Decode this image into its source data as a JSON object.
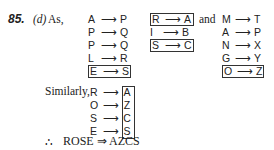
{
  "question": {
    "number": "85.",
    "option": "(d)",
    "intro": "As,"
  },
  "group1": [
    {
      "from": "A",
      "arrow": "⟶",
      "to": "P",
      "boxed": false
    },
    {
      "from": "P",
      "arrow": "⟶",
      "to": "Q",
      "boxed": false
    },
    {
      "from": "P",
      "arrow": "⟶",
      "to": "Q",
      "boxed": false
    },
    {
      "from": "L",
      "arrow": "⟶",
      "to": "R",
      "boxed": false
    },
    {
      "from": "E",
      "arrow": "⟶",
      "to": "S",
      "boxed": true
    }
  ],
  "group2": [
    {
      "from": "R",
      "arrow": "⟶",
      "to": "A",
      "boxed": true
    },
    {
      "from": "I",
      "arrow": "⟶",
      "to": "B",
      "boxed": false
    },
    {
      "from": "S",
      "arrow": "⟶",
      "to": "C",
      "boxed": true
    }
  ],
  "and_label": "and",
  "group3": [
    {
      "from": "M",
      "arrow": "⟶",
      "to": "T",
      "boxed": false
    },
    {
      "from": "A",
      "arrow": "⟶",
      "to": "P",
      "boxed": false
    },
    {
      "from": "N",
      "arrow": "⟶",
      "to": "X",
      "boxed": false
    },
    {
      "from": "G",
      "arrow": "⟶",
      "to": "Y",
      "boxed": false
    },
    {
      "from": "O",
      "arrow": "⟶",
      "to": "Z",
      "boxed": true
    }
  ],
  "similarly_label": "Similarly,",
  "result_map": [
    {
      "from": "R",
      "arrow": "⟶",
      "to": "A"
    },
    {
      "from": "O",
      "arrow": "⟶",
      "to": "Z"
    },
    {
      "from": "S",
      "arrow": "⟶",
      "to": "C"
    },
    {
      "from": "E",
      "arrow": "⟶",
      "to": "S"
    }
  ],
  "conclusion": {
    "therefore": "∴",
    "text": "ROSE ⇒ AZCS"
  }
}
